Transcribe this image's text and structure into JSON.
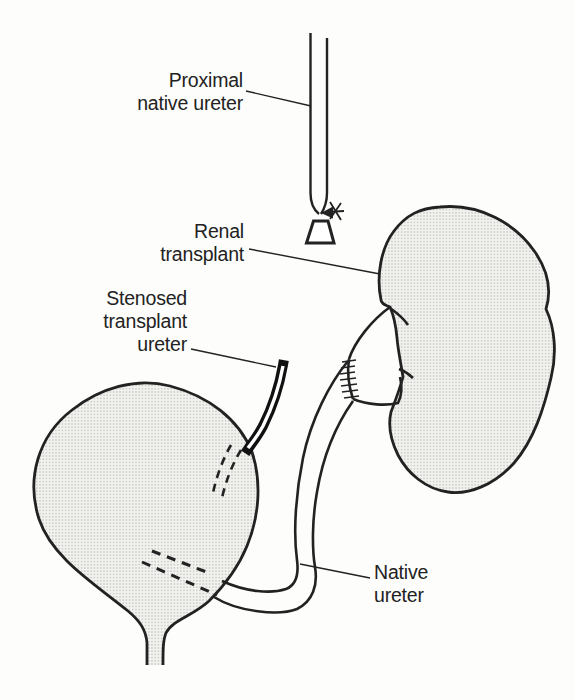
{
  "figure": {
    "kind": "medical line diagram",
    "description_visible_text_only": true,
    "labels": {
      "proximal_native_ureter": {
        "line1": "Proximal",
        "line2": "native ureter"
      },
      "renal_transplant": {
        "line1": "Renal",
        "line2": "transplant"
      },
      "stenosed_transplant_ureter": {
        "line1": "Stenosed",
        "line2": "transplant",
        "line3": "ureter"
      },
      "native_ureter": {
        "line1": "Native",
        "line2": "ureter"
      }
    },
    "colors": {
      "paper": "#fdfdfc",
      "ink": "#222222",
      "stipple_background": "#f2f2ef",
      "stipple_dot": "#9a9a98",
      "stenosed_ureter_wall": "#111111"
    }
  }
}
